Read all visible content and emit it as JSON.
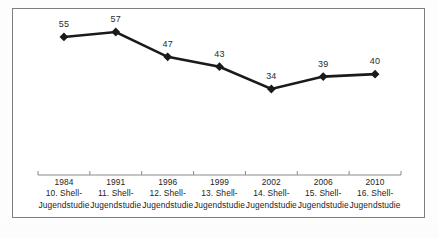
{
  "figure": {
    "background_color": "#ffffff",
    "frame_color": "#7d7d7d",
    "series_color": "#1a1a1a",
    "label_color": "#2b2b2b",
    "axis_color": "#8a8a8a"
  },
  "chart_data": {
    "type": "line",
    "title": "",
    "subtitle": "",
    "xlabel": "",
    "ylabel": "",
    "grid": false,
    "legend_position": "none",
    "marker": "diamond",
    "categories": [
      "1984\n10. Shell-\nJugendstudie",
      "1991\n11. Shell-\nJugendstudie",
      "1996\n12. Shell-\nJugendstudie",
      "1999\n13. Shell-\nJugendstudie",
      "2002\n14. Shell-\nJugendstudie",
      "2006\n15. Shell-\nJugendstudie",
      "2010\n16. Shell-\nJugendstudie"
    ],
    "x": [
      "1984",
      "1991",
      "1996",
      "1999",
      "2002",
      "2006",
      "2010"
    ],
    "values": [
      55,
      57,
      47,
      43,
      34,
      39,
      40
    ],
    "data_labels": [
      "55",
      "57",
      "47",
      "43",
      "34",
      "39",
      "40"
    ],
    "ylim": [
      0,
      80
    ],
    "xtick_labels": [
      "1984",
      "1991",
      "1996",
      "1999",
      "2002",
      "2006",
      "2010"
    ],
    "ytick_labels": [],
    "annotations": []
  },
  "categories": [
    {
      "year": "1984",
      "study": "10. Shell-",
      "series": "Jugendstudie",
      "value": "55"
    },
    {
      "year": "1991",
      "study": "11. Shell-",
      "series": "Jugendstudie",
      "value": "57"
    },
    {
      "year": "1996",
      "study": "12. Shell-",
      "series": "Jugendstudie",
      "value": "47"
    },
    {
      "year": "1999",
      "study": "13. Shell-",
      "series": "Jugendstudie",
      "value": "43"
    },
    {
      "year": "2002",
      "study": "14. Shell-",
      "series": "Jugendstudie",
      "value": "34"
    },
    {
      "year": "2006",
      "study": "15. Shell-",
      "series": "Jugendstudie",
      "value": "39"
    },
    {
      "year": "2010",
      "study": "16. Shell-",
      "series": "Jugendstudie",
      "value": "40"
    }
  ]
}
